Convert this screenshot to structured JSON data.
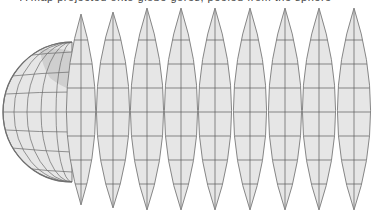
{
  "caption": {
    "text": "A map projected onto globe gores, peeled from the sphere",
    "note_visible": "caption cropped at top edge; only descenders visible"
  },
  "figure": {
    "colors": {
      "ocean": "#e6e6e6",
      "land": "#bdbdbd",
      "graticule": "#5a5a5a",
      "outline": "#7a7a7a",
      "background": "#ffffff"
    },
    "hemisphere": {
      "cx": 72,
      "cy": 112,
      "rx": 69,
      "ry": 70
    },
    "gores": [
      {
        "id": 1,
        "cx": 81,
        "half_width": 15,
        "top": 14,
        "bottom": 205,
        "label": "peeled gore"
      },
      {
        "id": 2,
        "cx": 113,
        "half_width": 17,
        "top": 12,
        "bottom": 208,
        "label": "Americas gore"
      },
      {
        "id": 3,
        "cx": 147,
        "half_width": 17,
        "top": 8,
        "bottom": 210,
        "label": "Atlantic gore"
      },
      {
        "id": 4,
        "cx": 181,
        "half_width": 17,
        "top": 8,
        "bottom": 210,
        "label": "Europe / West Africa gore"
      },
      {
        "id": 5,
        "cx": 215,
        "half_width": 17,
        "top": 8,
        "bottom": 210,
        "label": "Africa gore"
      },
      {
        "id": 6,
        "cx": 250,
        "half_width": 17,
        "top": 8,
        "bottom": 210,
        "label": "Asia / Indian Ocean gore"
      },
      {
        "id": 7,
        "cx": 285,
        "half_width": 17,
        "top": 8,
        "bottom": 210,
        "label": "East Asia gore"
      },
      {
        "id": 8,
        "cx": 319,
        "half_width": 17,
        "top": 8,
        "bottom": 210,
        "label": "Australia gore"
      },
      {
        "id": 9,
        "cx": 354,
        "half_width": 17,
        "top": 8,
        "bottom": 210,
        "label": "Pacific gore"
      }
    ],
    "parallels_y": [
      40,
      64,
      88,
      112,
      136,
      160,
      184
    ]
  }
}
